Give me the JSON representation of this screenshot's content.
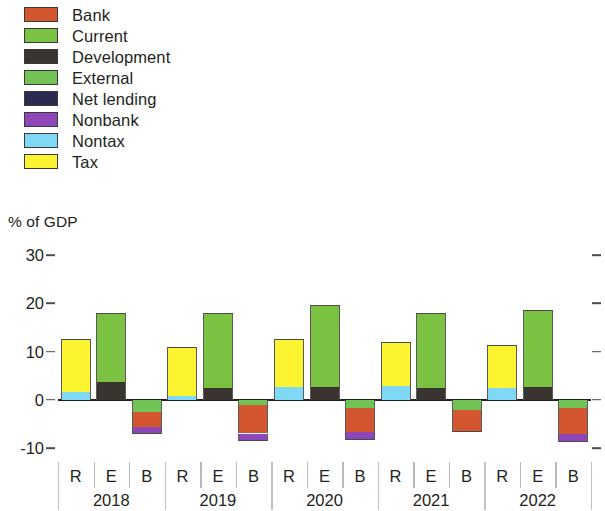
{
  "legend": {
    "items": [
      {
        "label": "Bank",
        "color": "#d4562f"
      },
      {
        "label": "Current",
        "color": "#7bc142"
      },
      {
        "label": "Development",
        "color": "#3a3430"
      },
      {
        "label": "External",
        "color": "#72c355"
      },
      {
        "label": "Net lending",
        "color": "#2b2b52"
      },
      {
        "label": "Nonbank",
        "color": "#8e46b8"
      },
      {
        "label": "Nontax",
        "color": "#7fd8f5"
      },
      {
        "label": "Tax",
        "color": "#fdf431"
      }
    ]
  },
  "axis": {
    "y_title": "% of GDP",
    "y_ticks": [
      30,
      20,
      10,
      0,
      -10
    ],
    "y_tick_labels": [
      "30",
      "20",
      "10",
      "0",
      "-10"
    ],
    "ylim": [
      -12,
      32
    ]
  },
  "chart_data": {
    "type": "bar",
    "subtype": "stacked",
    "title": "",
    "xlabel": "",
    "ylabel": "% of GDP",
    "ylim": [
      -12,
      32
    ],
    "grid": false,
    "legend_position": "top-left",
    "group_labels": [
      "2018",
      "2019",
      "2020",
      "2021",
      "2022"
    ],
    "bar_labels": [
      "R",
      "E",
      "B"
    ],
    "series": [
      {
        "name": "Bank",
        "color": "#d4562f"
      },
      {
        "name": "Current",
        "color": "#7bc142"
      },
      {
        "name": "Development",
        "color": "#3a3430"
      },
      {
        "name": "External",
        "color": "#72c355"
      },
      {
        "name": "Net lending",
        "color": "#2b2b52"
      },
      {
        "name": "Nonbank",
        "color": "#8e46b8"
      },
      {
        "name": "Nontax",
        "color": "#7fd8f5"
      },
      {
        "name": "Tax",
        "color": "#fdf431"
      }
    ],
    "groups": [
      {
        "year": "2018",
        "bars": [
          {
            "label": "R",
            "segments": [
              {
                "series": "Nontax",
                "value": 1.7
              },
              {
                "series": "Tax",
                "value": 11.0
              }
            ]
          },
          {
            "label": "E",
            "segments": [
              {
                "series": "Development",
                "value": 3.6
              },
              {
                "series": "Current",
                "value": 14.5
              }
            ]
          },
          {
            "label": "B",
            "segments": [
              {
                "series": "External",
                "value": -2.6
              },
              {
                "series": "Bank",
                "value": -3.0
              },
              {
                "series": "Nonbank",
                "value": -1.5
              }
            ]
          }
        ]
      },
      {
        "year": "2019",
        "bars": [
          {
            "label": "R",
            "segments": [
              {
                "series": "Nontax",
                "value": 0.7
              },
              {
                "series": "Tax",
                "value": 10.2
              }
            ]
          },
          {
            "label": "E",
            "segments": [
              {
                "series": "Development",
                "value": 2.4
              },
              {
                "series": "Current",
                "value": 15.7
              }
            ]
          },
          {
            "label": "B",
            "segments": [
              {
                "series": "External",
                "value": -1.1
              },
              {
                "series": "Bank",
                "value": -5.9
              },
              {
                "series": "Nonbank",
                "value": -1.6
              }
            ]
          }
        ]
      },
      {
        "year": "2020",
        "bars": [
          {
            "label": "R",
            "segments": [
              {
                "series": "Nontax",
                "value": 2.7
              },
              {
                "series": "Tax",
                "value": 10.0
              }
            ]
          },
          {
            "label": "E",
            "segments": [
              {
                "series": "Development",
                "value": 2.6
              },
              {
                "series": "Current",
                "value": 17.1
              }
            ]
          },
          {
            "label": "B",
            "segments": [
              {
                "series": "External",
                "value": -1.7
              },
              {
                "series": "Bank",
                "value": -4.9
              },
              {
                "series": "Nonbank",
                "value": -1.7
              }
            ]
          }
        ]
      },
      {
        "year": "2021",
        "bars": [
          {
            "label": "R",
            "segments": [
              {
                "series": "Nontax",
                "value": 2.9
              },
              {
                "series": "Tax",
                "value": 9.0
              }
            ]
          },
          {
            "label": "E",
            "segments": [
              {
                "series": "Development",
                "value": 2.4
              },
              {
                "series": "Current",
                "value": 15.6
              }
            ]
          },
          {
            "label": "B",
            "segments": [
              {
                "series": "External",
                "value": -2.2
              },
              {
                "series": "Bank",
                "value": -4.2
              },
              {
                "series": "Nonbank",
                "value": -0.3
              }
            ]
          }
        ]
      },
      {
        "year": "2022",
        "bars": [
          {
            "label": "R",
            "segments": [
              {
                "series": "Nontax",
                "value": 2.4
              },
              {
                "series": "Tax",
                "value": 9.0
              }
            ]
          },
          {
            "label": "E",
            "segments": [
              {
                "series": "Development",
                "value": 2.6
              },
              {
                "series": "Current",
                "value": 16.1
              }
            ]
          },
          {
            "label": "B",
            "segments": [
              {
                "series": "External",
                "value": -1.8
              },
              {
                "series": "Bank",
                "value": -5.3
              },
              {
                "series": "Nonbank",
                "value": -1.7
              }
            ]
          }
        ]
      }
    ]
  }
}
